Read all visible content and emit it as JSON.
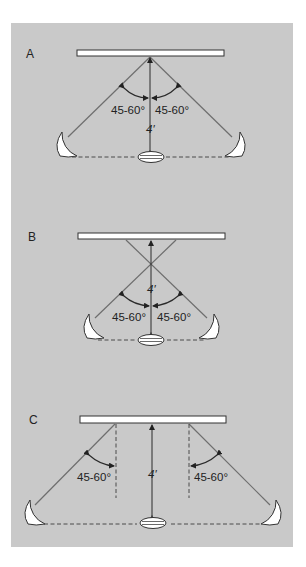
{
  "figure": {
    "background_color": "#c9c9c9",
    "panels": [
      {
        "letter": "A",
        "description": "Lights behind subject, angled 45-60° toward background center",
        "angle_left": "45-60°",
        "angle_right": "45-60°",
        "distance": "4′"
      },
      {
        "letter": "B",
        "description": "Lights close to subject, beams crossing before background",
        "angle_left": "45-60°",
        "angle_right": "45-60°",
        "distance": "4′"
      },
      {
        "letter": "C",
        "description": "Lights wide apart, each angled 45-60° from vertical reference",
        "angle_left": "45-60°",
        "angle_right": "45-60°",
        "distance": "4′"
      }
    ]
  }
}
